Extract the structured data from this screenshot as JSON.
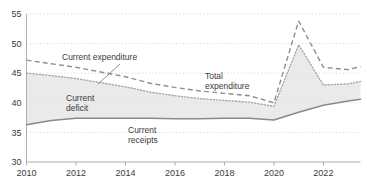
{
  "chart_data": {
    "type": "line",
    "title": "",
    "subtitle": "",
    "xlabel": "",
    "ylabel": "",
    "xlim": [
      2010,
      2023.5
    ],
    "ylim": [
      30,
      55
    ],
    "grid": true,
    "legend_position": "inline-annotations",
    "x_ticks": [
      "2010",
      "2012",
      "2014",
      "2016",
      "2018",
      "2020",
      "2022"
    ],
    "x_tick_values": [
      2010,
      2012,
      2014,
      2016,
      2018,
      2020,
      2022
    ],
    "y_ticks": [
      "30",
      "35",
      "40",
      "45",
      "50",
      "55"
    ],
    "y_tick_values": [
      30,
      35,
      40,
      45,
      50,
      55
    ],
    "x": [
      2010,
      2011,
      2012,
      2013,
      2014,
      2015,
      2016,
      2017,
      2018,
      2019,
      2020,
      2021,
      2022,
      2023,
      2023.5
    ],
    "series": [
      {
        "name": "Total expenditure",
        "style": "dashed",
        "values": [
          47.2,
          46.6,
          46.0,
          45.2,
          44.4,
          43.3,
          42.6,
          42.0,
          41.6,
          41.2,
          40.0,
          53.8,
          46.0,
          45.6,
          46.1
        ]
      },
      {
        "name": "Current expenditure",
        "style": "dotted",
        "values": [
          45.0,
          44.6,
          44.1,
          43.4,
          42.7,
          41.8,
          41.2,
          40.7,
          40.4,
          40.1,
          39.4,
          49.8,
          43.0,
          43.2,
          43.6
        ]
      },
      {
        "name": "Current receipts",
        "style": "solid",
        "values": [
          36.3,
          37.0,
          37.4,
          37.4,
          37.4,
          37.4,
          37.3,
          37.3,
          37.4,
          37.4,
          37.1,
          38.4,
          39.6,
          40.3,
          40.6
        ]
      }
    ],
    "shaded_regions": [
      {
        "name": "Current deficit",
        "between": [
          "Current expenditure",
          "Current receipts"
        ],
        "fill": "#e6e6e6"
      }
    ],
    "annotations": [
      {
        "text": "Current expenditure",
        "x_px": 62,
        "y_px": 60,
        "leader": true
      },
      {
        "text": "Total",
        "x_px": 205,
        "y_px": 79,
        "leader": false
      },
      {
        "text": "expenditure",
        "x_px": 205,
        "y_px": 89,
        "leader": false
      },
      {
        "text": "Current",
        "x_px": 66,
        "y_px": 101,
        "leader": false
      },
      {
        "text": "deficit",
        "x_px": 66,
        "y_px": 111,
        "leader": false
      },
      {
        "text": "Current",
        "x_px": 128,
        "y_px": 133,
        "leader": false
      },
      {
        "text": "receipts",
        "x_px": 128,
        "y_px": 143,
        "leader": false
      }
    ],
    "colors": {
      "grid": "#c8c8c8",
      "axis": "#9a9a9a",
      "total_expenditure": "#8f8f8f",
      "current_expenditure": "#a8a8a8",
      "current_receipts": "#8a8a8a",
      "deficit_fill": "#e6e6e6",
      "text": "#3b3b3b",
      "background": "#ffffff"
    }
  }
}
